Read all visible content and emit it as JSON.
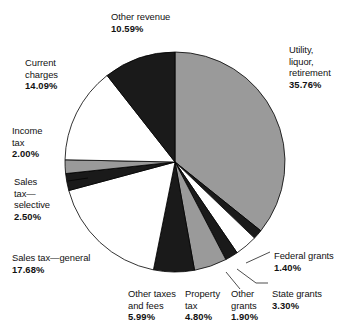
{
  "chart_data": {
    "type": "pie",
    "title": "",
    "subtitle": "",
    "xlabel": "",
    "ylabel": "",
    "legend_position": "none",
    "grid": false,
    "units": "percent",
    "total": 100.0,
    "start_angle_deg": 0,
    "direction": "clockwise",
    "center": {
      "x": 175,
      "y": 162
    },
    "radius": 110,
    "categories": [
      "Utility, liquor, retirement",
      "Federal grants",
      "State grants",
      "Other grants",
      "Property tax",
      "Other taxes and fees",
      "Sales tax—general",
      "Sales tax—selective",
      "Income tax",
      "Current charges",
      "Other revenue"
    ],
    "values": [
      35.76,
      1.4,
      3.3,
      1.9,
      4.8,
      5.99,
      17.68,
      2.5,
      2.0,
      14.09,
      10.59
    ],
    "slice_colors": [
      "#9a9a9a",
      "#1a1a1a",
      "#ffffff",
      "#1a1a1a",
      "#9a9a9a",
      "#1a1a1a",
      "#ffffff",
      "#1a1a1a",
      "#9a9a9a",
      "#ffffff",
      "#1a1a1a"
    ],
    "slice_outline_color": "#000000",
    "slices": [
      {
        "name": "Utility, liquor, retirement",
        "name_lines": "Utility, liquor,\nretirement",
        "value": 35.76,
        "value_label": "35.76%",
        "color": "#9a9a9a",
        "label_x": 289,
        "label_y": 44,
        "label_align": "left",
        "leader": false
      },
      {
        "name": "Federal grants",
        "name_lines": "Federal grants",
        "value": 1.4,
        "value_label": "1.40%",
        "color": "#1a1a1a",
        "label_x": 274,
        "label_y": 250,
        "label_align": "left",
        "leader": true
      },
      {
        "name": "State grants",
        "name_lines": "State grants",
        "value": 3.3,
        "value_label": "3.30%",
        "color": "#ffffff",
        "label_x": 272,
        "label_y": 288,
        "label_align": "left",
        "leader": true
      },
      {
        "name": "Other grants",
        "name_lines": "Other\ngrants",
        "value": 1.9,
        "value_label": "1.90%",
        "color": "#1a1a1a",
        "label_x": 231,
        "label_y": 288,
        "label_align": "left",
        "leader": true
      },
      {
        "name": "Property tax",
        "name_lines": "Property\ntax",
        "value": 4.8,
        "value_label": "4.80%",
        "color": "#9a9a9a",
        "label_x": 185,
        "label_y": 288,
        "label_align": "left",
        "leader": false
      },
      {
        "name": "Other taxes and fees",
        "name_lines": "Other taxes\nand fees",
        "value": 5.99,
        "value_label": "5.99%",
        "color": "#1a1a1a",
        "label_x": 128,
        "label_y": 288,
        "label_align": "left",
        "leader": false
      },
      {
        "name": "Sales tax—general",
        "name_lines": "Sales tax—general",
        "value": 17.68,
        "value_label": "17.68%",
        "color": "#ffffff",
        "label_x": 12,
        "label_y": 252,
        "label_align": "left",
        "leader": false
      },
      {
        "name": "Sales tax—selective",
        "name_lines": "Sales\ntax—\nselective",
        "value": 2.5,
        "value_label": "2.50%",
        "color": "#1a1a1a",
        "label_x": 14,
        "label_y": 176,
        "label_align": "left",
        "leader": true
      },
      {
        "name": "Income tax",
        "name_lines": "Income\ntax",
        "value": 2.0,
        "value_label": "2.00%",
        "color": "#9a9a9a",
        "label_x": 12,
        "label_y": 125,
        "label_align": "left",
        "leader": false
      },
      {
        "name": "Current charges",
        "name_lines": "Current\ncharges",
        "value": 14.09,
        "value_label": "14.09%",
        "color": "#ffffff",
        "label_x": 25,
        "label_y": 57,
        "label_align": "left",
        "leader": false
      },
      {
        "name": "Other revenue",
        "name_lines": "Other revenue",
        "value": 10.59,
        "value_label": "10.59%",
        "color": "#1a1a1a",
        "label_x": 111,
        "label_y": 11,
        "label_align": "left",
        "leader": false
      }
    ],
    "leader_lines": [
      {
        "name": "federal-grants-leader",
        "x1": 246,
        "y1": 263,
        "x2": 270,
        "y2": 252
      },
      {
        "name": "state-grants-leader",
        "x1": 237,
        "y1": 269,
        "x2": 256,
        "y2": 283,
        "x3": 268,
        "y3": 283
      },
      {
        "name": "other-grants-leader",
        "x1": 226,
        "y1": 272,
        "x2": 240,
        "y2": 289
      },
      {
        "name": "sales-tax-selective-leader",
        "x1": 68,
        "y1": 181,
        "x2": 88,
        "y2": 178
      }
    ]
  }
}
